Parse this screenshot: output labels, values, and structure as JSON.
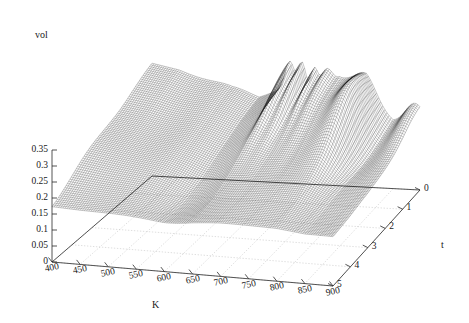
{
  "figure": {
    "type": "3d-surface-mesh",
    "background": "#ffffff",
    "mesh_color": "#1a1a1a",
    "grid_color": "#b8b8b8",
    "axis_color": "#222222"
  },
  "axes": {
    "z": {
      "name": "vol",
      "ticks": [
        "0.35",
        "0.3",
        "0.25",
        "0.2",
        "0.15",
        "0.1",
        "0.05",
        "0"
      ],
      "values": [
        0.35,
        0.3,
        0.25,
        0.2,
        0.15,
        0.1,
        0.05,
        0
      ],
      "range": [
        0,
        0.35
      ]
    },
    "x": {
      "name": "K",
      "ticks": [
        "400",
        "450",
        "500",
        "550",
        "600",
        "650",
        "700",
        "750",
        "800",
        "850",
        "900"
      ],
      "values": [
        400,
        450,
        500,
        550,
        600,
        650,
        700,
        750,
        800,
        850,
        900
      ],
      "range": [
        400,
        900
      ]
    },
    "y": {
      "name": "t",
      "ticks": [
        "0",
        "1",
        "2",
        "3",
        "4",
        "5"
      ],
      "values": [
        0,
        1,
        2,
        3,
        4,
        5
      ],
      "range": [
        0,
        5
      ]
    }
  },
  "chart_data": {
    "type": "surface",
    "title": "",
    "xlabel": "K",
    "ylabel": "t",
    "zlabel": "vol",
    "xlim": [
      400,
      900
    ],
    "ylim": [
      0,
      5
    ],
    "zlim": [
      0,
      0.35
    ],
    "grid": true,
    "legend": "none",
    "x": [
      400,
      450,
      500,
      550,
      600,
      650,
      700,
      750,
      800,
      850,
      900
    ],
    "y": [
      0,
      1,
      2,
      3,
      4,
      5
    ],
    "z": [
      [
        0.345,
        0.33,
        0.3,
        0.268,
        0.255,
        0.3,
        0.275,
        0.33,
        0.31,
        0.225,
        0.215
      ],
      [
        0.32,
        0.305,
        0.278,
        0.25,
        0.24,
        0.285,
        0.262,
        0.3,
        0.288,
        0.21,
        0.2
      ],
      [
        0.288,
        0.272,
        0.25,
        0.228,
        0.22,
        0.258,
        0.24,
        0.262,
        0.252,
        0.192,
        0.185
      ],
      [
        0.252,
        0.238,
        0.222,
        0.205,
        0.198,
        0.222,
        0.212,
        0.22,
        0.214,
        0.175,
        0.17
      ],
      [
        0.215,
        0.204,
        0.195,
        0.184,
        0.18,
        0.192,
        0.188,
        0.188,
        0.184,
        0.162,
        0.16
      ],
      [
        0.18,
        0.175,
        0.172,
        0.168,
        0.166,
        0.17,
        0.17,
        0.168,
        0.166,
        0.156,
        0.155
      ]
    ]
  }
}
